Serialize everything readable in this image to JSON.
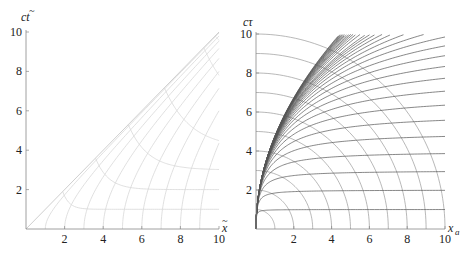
{
  "chart_data": [
    {
      "type": "line",
      "name": "left-plot",
      "title": "",
      "xlabel": "x̃",
      "ylabel": "ct̃",
      "xlim": [
        0,
        10
      ],
      "ylim": [
        0,
        10
      ],
      "xticks": [
        "2",
        "4",
        "6",
        "8",
        "10"
      ],
      "yticks": [
        "2",
        "4",
        "6",
        "8",
        "10"
      ],
      "grid": false,
      "line_color": "#d8d8d8",
      "series": [
        {
          "name": "light-cone",
          "description": "ct̃ = x̃ diagonal"
        },
        {
          "name": "hyperbolas",
          "description": "x̃² − (ct̃)² = k², k = 1..10",
          "k": [
            1,
            2,
            3,
            4,
            5,
            6,
            7,
            8,
            9,
            10
          ]
        },
        {
          "name": "flattening-curves",
          "description": "curves starting on diagonal and flattening to ct̃ ≈ level at x̃ = 10",
          "levels": [
            1,
            2,
            3,
            4.1,
            5.3,
            7
          ]
        }
      ]
    },
    {
      "type": "line",
      "name": "right-plot",
      "title": "",
      "xlabel": "x_a",
      "ylabel": "cτ",
      "xlim": [
        0,
        10
      ],
      "ylim": [
        0,
        10
      ],
      "xticks": [
        "2",
        "4",
        "6",
        "8",
        "10"
      ],
      "yticks": [
        "2",
        "4",
        "6",
        "8",
        "10"
      ],
      "grid": false,
      "line_color": "#555555",
      "arc_color": "#9a9a9a",
      "series": [
        {
          "name": "circular-arcs",
          "description": "quarter circles centered at origin",
          "radii": [
            1,
            2,
            3,
            4,
            5,
            6,
            7,
            8,
            9,
            10
          ]
        },
        {
          "name": "constant-level-curves",
          "description": "curves emanating from origin, flattening to cτ = level",
          "levels": [
            1,
            2,
            3,
            4,
            5,
            6,
            7,
            8,
            9,
            10,
            11,
            12,
            13,
            14,
            15,
            16,
            17,
            18,
            19,
            20,
            22,
            24,
            26,
            28,
            30,
            33,
            36,
            40,
            45,
            50,
            60,
            75,
            100
          ]
        }
      ]
    }
  ],
  "labels": {
    "left_y": "ct",
    "left_y_accent": "~",
    "left_x": "x",
    "left_x_accent": "~",
    "right_y": "cτ",
    "right_x": "x",
    "right_x_sub": "a"
  }
}
